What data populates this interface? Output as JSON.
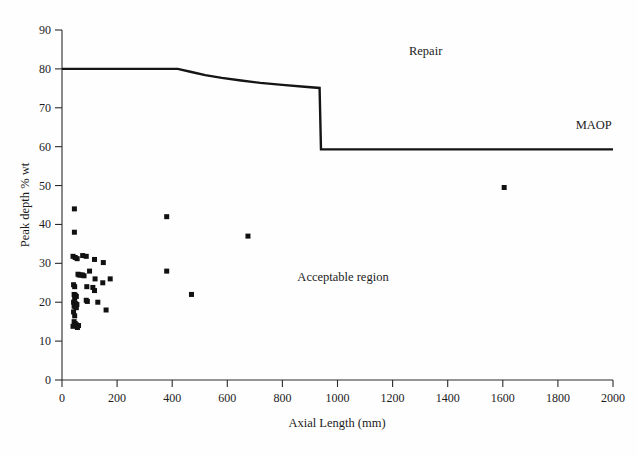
{
  "chart_data": {
    "type": "scatter",
    "title": "",
    "xlabel": "Axial Length (mm)",
    "ylabel": "Peak depth % wt",
    "xlim": [
      0,
      2000
    ],
    "ylim": [
      0,
      90
    ],
    "xticks": [
      0,
      200,
      400,
      600,
      800,
      1000,
      1200,
      1400,
      1600,
      1800,
      2000
    ],
    "yticks": [
      0,
      10,
      20,
      30,
      40,
      50,
      60,
      70,
      80,
      90
    ],
    "grid": false,
    "legend_position": "none",
    "annotations": [
      {
        "text": "Repair",
        "x": 1320,
        "y": 83.5
      },
      {
        "text": "MAOP",
        "x": 1930,
        "y": 64.5
      },
      {
        "text": "Acceptable region",
        "x": 1020,
        "y": 25.5
      }
    ],
    "series": [
      {
        "name": "Repair criterion curve",
        "type": "line",
        "color": "#151515",
        "points": [
          [
            0,
            80.0
          ],
          [
            420,
            80.0
          ],
          [
            470,
            79.2
          ],
          [
            520,
            78.4
          ],
          [
            580,
            77.7
          ],
          [
            650,
            77.0
          ],
          [
            720,
            76.4
          ],
          [
            800,
            75.9
          ],
          [
            880,
            75.4
          ],
          [
            935,
            75.1
          ],
          [
            940,
            59.3
          ],
          [
            2000,
            59.3
          ]
        ]
      },
      {
        "name": "Measured defects",
        "type": "scatter",
        "marker": "square",
        "color": "#111111",
        "points": [
          [
            45,
            44.0
          ],
          [
            45,
            38.0
          ],
          [
            40,
            31.8
          ],
          [
            48,
            31.5
          ],
          [
            55,
            31.2
          ],
          [
            75,
            32.0
          ],
          [
            88,
            31.8
          ],
          [
            118,
            31.0
          ],
          [
            150,
            30.2
          ],
          [
            100,
            28.0
          ],
          [
            58,
            27.2
          ],
          [
            62,
            27.0
          ],
          [
            68,
            27.0
          ],
          [
            74,
            27.0
          ],
          [
            80,
            26.8
          ],
          [
            120,
            26.0
          ],
          [
            148,
            25.0
          ],
          [
            175,
            26.0
          ],
          [
            42,
            24.5
          ],
          [
            46,
            24.0
          ],
          [
            90,
            24.0
          ],
          [
            112,
            23.8
          ],
          [
            118,
            23.0
          ],
          [
            44,
            22.0
          ],
          [
            48,
            21.8
          ],
          [
            52,
            21.5
          ],
          [
            46,
            21.0
          ],
          [
            88,
            20.5
          ],
          [
            92,
            20.2
          ],
          [
            130,
            20.0
          ],
          [
            42,
            20.0
          ],
          [
            46,
            19.8
          ],
          [
            50,
            19.6
          ],
          [
            54,
            19.4
          ],
          [
            44,
            19.0
          ],
          [
            48,
            18.8
          ],
          [
            52,
            18.6
          ],
          [
            160,
            18.0
          ],
          [
            42,
            17.5
          ],
          [
            46,
            16.5
          ],
          [
            44,
            15.0
          ],
          [
            48,
            14.5
          ],
          [
            52,
            14.2
          ],
          [
            40,
            13.8
          ],
          [
            56,
            13.5
          ],
          [
            60,
            14.0
          ],
          [
            380,
            42.0
          ],
          [
            470,
            22.0
          ],
          [
            380,
            28.0
          ],
          [
            675,
            37.0
          ],
          [
            1605,
            49.5
          ]
        ]
      }
    ]
  },
  "figure": {
    "background_color": "#fefefe",
    "axis_color": "#2b2b2b",
    "marker_color": "#111111",
    "curve_color": "#151515"
  }
}
